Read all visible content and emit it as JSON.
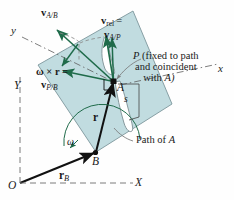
{
  "figure": {
    "colors": {
      "plate_fill": "#bcd9dd",
      "plate_stroke": "#6f8f96",
      "vector_green": "#1f6b4a",
      "axis_black": "#111111",
      "path_outline": "#7d8f93",
      "dashed_gray": "#8a8a8a"
    }
  },
  "axes": {
    "fixed": {
      "x_label": "X",
      "y_label": "Y",
      "origin_label": "O"
    },
    "rotating": {
      "x_label": "x",
      "y_label": "y"
    }
  },
  "points": {
    "A": "A",
    "B": "B",
    "P_note_line1": "P (fixed to path",
    "P_note_line2": "and coincident",
    "P_note_line3": "with A)",
    "P_symbol": "P"
  },
  "vectors": {
    "v_A_over_B": {
      "symbol": "v",
      "sub": "A/B"
    },
    "v_rel": {
      "symbol": "v",
      "sub": "rel",
      "equals": "="
    },
    "v_A_over_P": {
      "symbol": "v",
      "sub": "A/P"
    },
    "omega_cross_r": {
      "text": "ω × r ="
    },
    "v_P_over_B": {
      "symbol": "v",
      "sub": "P/B"
    },
    "r": "r",
    "r_B": {
      "symbol": "r",
      "sub": "B"
    }
  },
  "labels": {
    "omega": "ω",
    "s": "s",
    "path_of_A": "Path of A"
  }
}
